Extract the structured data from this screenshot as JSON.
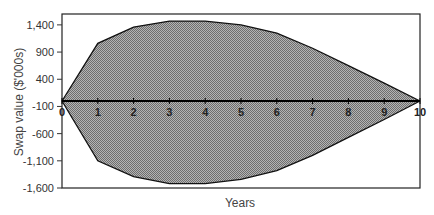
{
  "chart_data": {
    "type": "area",
    "title": "",
    "xlabel": "Years",
    "ylabel": "Swap value ($'000s)",
    "x": [
      0,
      1,
      2,
      3,
      4,
      5,
      6,
      7,
      8,
      9,
      10
    ],
    "x_tick_labels": [
      "0",
      "1",
      "2",
      "3",
      "4",
      "5",
      "6",
      "7",
      "8",
      "9",
      "10"
    ],
    "y_ticks": [
      1400,
      900,
      400,
      -100,
      -600,
      -1100,
      -1600
    ],
    "y_tick_labels": [
      "1,400",
      "900",
      "400",
      "-100",
      "-600",
      "-1,100",
      "-1,600"
    ],
    "ylim": [
      -1600,
      1600
    ],
    "xlim": [
      0,
      10
    ],
    "grid": false,
    "legend": "none",
    "series": [
      {
        "name": "Upper bound",
        "values": [
          0,
          1060,
          1360,
          1470,
          1470,
          1400,
          1250,
          970,
          650,
          330,
          0
        ]
      },
      {
        "name": "Lower bound",
        "values": [
          0,
          -1100,
          -1390,
          -1520,
          -1520,
          -1440,
          -1280,
          -1000,
          -670,
          -340,
          0
        ]
      }
    ],
    "colors": {
      "fill_dark": "#6e6e6e",
      "fill_light": "#b4b4b4",
      "line": "#111111",
      "frame": "#222222"
    }
  }
}
